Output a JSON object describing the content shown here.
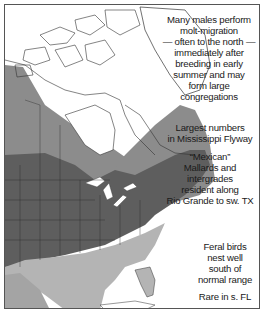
{
  "map": {
    "subject": "Mallard range map",
    "colors": {
      "year_round": "#5e5e5e",
      "breeding": "#8c8c8c",
      "winter": "#b4b4b4",
      "non_range": "#ffffff",
      "water": "#ffffff",
      "borders": "#333333"
    },
    "annotations": {
      "molt": {
        "lines": [
          "Many males perform",
          "molt-migration",
          "— often to the north —",
          "immediately after",
          "breeding in early",
          "summer and may",
          "form large",
          "congregations"
        ]
      },
      "flyway": {
        "lines": [
          "Largest numbers",
          "in Mississippi Flyway"
        ]
      },
      "mexican": {
        "lines": [
          "“Mexican”",
          "Mallards and",
          "intergrades",
          "resident along",
          "Rio Grande to sw. TX"
        ]
      },
      "feral": {
        "lines": [
          "Feral birds",
          "nest well",
          "south of",
          "normal range"
        ]
      },
      "florida": {
        "lines": [
          "Rare in s. FL"
        ]
      }
    }
  }
}
